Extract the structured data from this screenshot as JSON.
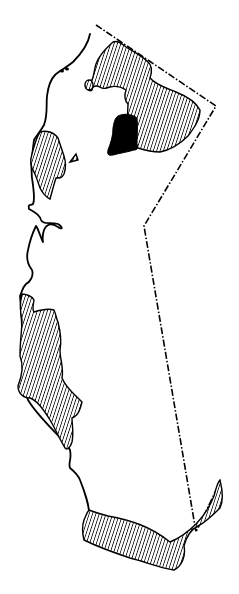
{
  "map": {
    "title": "",
    "description": "Outline map of an elongated region with hatched shaded areas and one solid black area",
    "colors": {
      "background": "#ffffff",
      "outline": "#000000",
      "hatch": "#000000",
      "solid": "#000000"
    },
    "legend": [],
    "regions": [
      {
        "name": "northeast-hatched-area",
        "fill": "hatched"
      },
      {
        "name": "north-solid-area",
        "fill": "solid"
      },
      {
        "name": "northwest-coastal-hatched-area",
        "fill": "hatched"
      },
      {
        "name": "central-coastal-hatched-area",
        "fill": "hatched"
      },
      {
        "name": "southern-hatched-area",
        "fill": "hatched"
      }
    ],
    "boundaries": [
      {
        "name": "coastline",
        "style": "solid"
      },
      {
        "name": "eastern-border",
        "style": "dash-dot"
      }
    ]
  }
}
